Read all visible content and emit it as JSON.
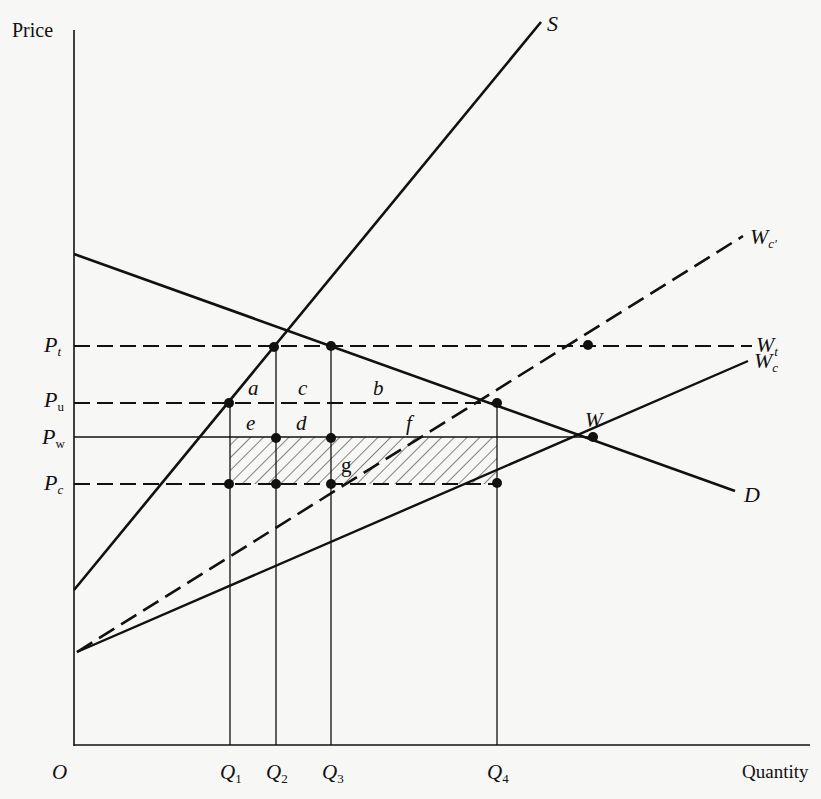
{
  "diagram": {
    "type": "economics-supply-demand",
    "axes": {
      "y_label": "Price",
      "x_label": "Quantity",
      "origin": "O"
    },
    "price_levels": [
      {
        "id": "Pt",
        "base": "P",
        "sub": "t"
      },
      {
        "id": "Pu",
        "base": "P",
        "sub": "u"
      },
      {
        "id": "Pw",
        "base": "P",
        "sub": "w"
      },
      {
        "id": "Pc",
        "base": "P",
        "sub": "c"
      }
    ],
    "quantity_levels": [
      {
        "id": "Q1",
        "base": "Q",
        "sub": "1"
      },
      {
        "id": "Q2",
        "base": "Q",
        "sub": "2"
      },
      {
        "id": "Q3",
        "base": "Q",
        "sub": "3"
      },
      {
        "id": "Q4",
        "base": "Q",
        "sub": "4"
      }
    ],
    "curves": [
      {
        "id": "S",
        "label": "S",
        "style": "solid"
      },
      {
        "id": "D",
        "label": "D",
        "style": "solid"
      },
      {
        "id": "Wc",
        "base": "W",
        "sub": "c",
        "style": "solid"
      },
      {
        "id": "Wc_prime",
        "base": "W",
        "sub": "c'",
        "style": "dashed"
      },
      {
        "id": "Wt",
        "base": "W",
        "sub": "t",
        "style": "dashed"
      }
    ],
    "point_labels": {
      "W": "W"
    },
    "area_labels": [
      "a",
      "b",
      "c",
      "d",
      "e",
      "f",
      "g"
    ],
    "shaded_region": "Pw-Pc between Q1 and Q4 (hatched)"
  }
}
